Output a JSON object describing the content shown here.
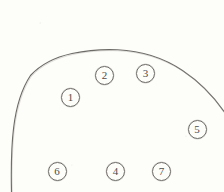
{
  "figure": {
    "background_color": "#fdfdfa",
    "ink_color": "#6d6b66",
    "digit_color": "#4e4c48",
    "width": 224,
    "height": 192,
    "outline": {
      "name": "dome-shaped-specimen-outline",
      "description": "Hand-drawn dome / arch shaped contour open at the bottom, left side nearly vertical, right side exiting the right edge of the frame",
      "apex_x": 117,
      "apex_y": 50,
      "left_edge_x": 11,
      "left_edge_bottom_y": 192,
      "right_exit_x": 224,
      "right_exit_y": 112
    },
    "markers": [
      {
        "label": "1",
        "cx": 70.5,
        "cy": 97.0,
        "d": 19
      },
      {
        "label": "2",
        "cx": 104.5,
        "cy": 75.0,
        "d": 19
      },
      {
        "label": "3",
        "cx": 145.5,
        "cy": 73.5,
        "d": 19
      },
      {
        "label": "4",
        "cx": 115.5,
        "cy": 171.5,
        "d": 19
      },
      {
        "label": "5",
        "cx": 197.0,
        "cy": 129.5,
        "d": 19
      },
      {
        "label": "6",
        "cx": 57.0,
        "cy": 171.5,
        "d": 19
      },
      {
        "label": "7",
        "cx": 161.5,
        "cy": 171.5,
        "d": 19
      }
    ]
  }
}
